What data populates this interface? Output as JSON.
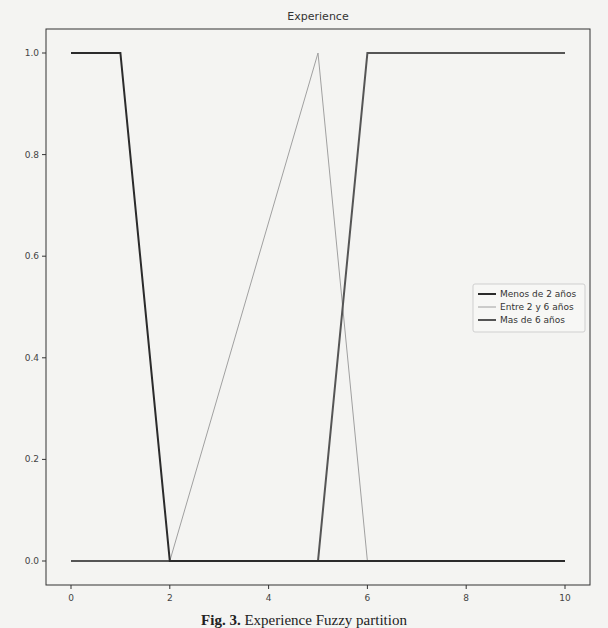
{
  "chart_data": {
    "type": "line",
    "title": "Experience",
    "xlabel": "",
    "ylabel": "",
    "xlim": [
      -0.5,
      10.5
    ],
    "ylim": [
      -0.05,
      1.05
    ],
    "grid": false,
    "legend_position": "center right",
    "xticks": [
      0,
      2,
      4,
      6,
      8,
      10
    ],
    "xtick_labels": [
      "0",
      "2",
      "4",
      "6",
      "8",
      "10"
    ],
    "yticks": [
      0.0,
      0.2,
      0.4,
      0.6,
      0.8,
      1.0
    ],
    "ytick_labels": [
      "0.0",
      "0.2",
      "0.4",
      "0.6",
      "0.8",
      "1.0"
    ],
    "series": [
      {
        "name": "Menos de 2 años",
        "color": "#2b2b2b",
        "width": 2,
        "x": [
          0,
          1,
          2,
          10
        ],
        "y": [
          1,
          1,
          0,
          0
        ]
      },
      {
        "name": "Entre 2 y 6 años",
        "color": "#a0a0a0",
        "width": 1,
        "x": [
          0,
          2,
          5,
          6,
          10
        ],
        "y": [
          0,
          0,
          1,
          0,
          0
        ]
      },
      {
        "name": "Mas de 6 años",
        "color": "#555555",
        "width": 2,
        "x": [
          0,
          5,
          6,
          10
        ],
        "y": [
          0,
          0,
          1,
          1
        ]
      }
    ]
  },
  "caption": {
    "label": "Fig. 3.",
    "text": "Experience Fuzzy partition"
  }
}
